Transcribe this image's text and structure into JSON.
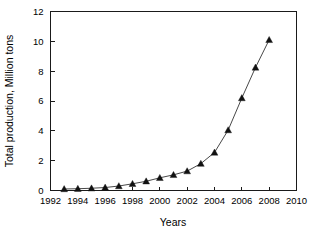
{
  "chart_data": {
    "type": "line",
    "title": "",
    "xlabel": "Years",
    "ylabel": "Total production, Million tons",
    "xlim": [
      1992,
      2010
    ],
    "ylim": [
      0,
      12
    ],
    "xticks": [
      1992,
      1994,
      1996,
      1998,
      2000,
      2002,
      2004,
      2006,
      2008,
      2010
    ],
    "yticks": [
      0,
      2,
      4,
      6,
      8,
      10,
      12
    ],
    "xtick_labels": [
      "1992",
      "1994",
      "1996",
      "1998",
      "2000",
      "2002",
      "2004",
      "2006",
      "2008",
      "2010"
    ],
    "ytick_labels": [
      "0",
      "2",
      "4",
      "6",
      "8",
      "10",
      "12"
    ],
    "grid": false,
    "legend": null,
    "marker": "triangle",
    "line_color": "#333333",
    "marker_color": "#111111",
    "x": [
      1993,
      1994,
      1995,
      1996,
      1997,
      1998,
      1999,
      2000,
      2001,
      2002,
      2003,
      2004,
      2005,
      2006,
      2007,
      2008
    ],
    "values": [
      0.1,
      0.12,
      0.15,
      0.2,
      0.3,
      0.45,
      0.62,
      0.85,
      1.05,
      1.3,
      1.8,
      2.55,
      4.05,
      6.2,
      8.25,
      10.1
    ],
    "series": [
      {
        "name": "Total production",
        "values": [
          0.1,
          0.12,
          0.15,
          0.2,
          0.3,
          0.45,
          0.62,
          0.85,
          1.05,
          1.3,
          1.8,
          2.55,
          4.05,
          6.2,
          8.25,
          10.1
        ]
      }
    ]
  },
  "axes": {
    "x_title": "Years",
    "y_title": "Total production, Million tons"
  }
}
